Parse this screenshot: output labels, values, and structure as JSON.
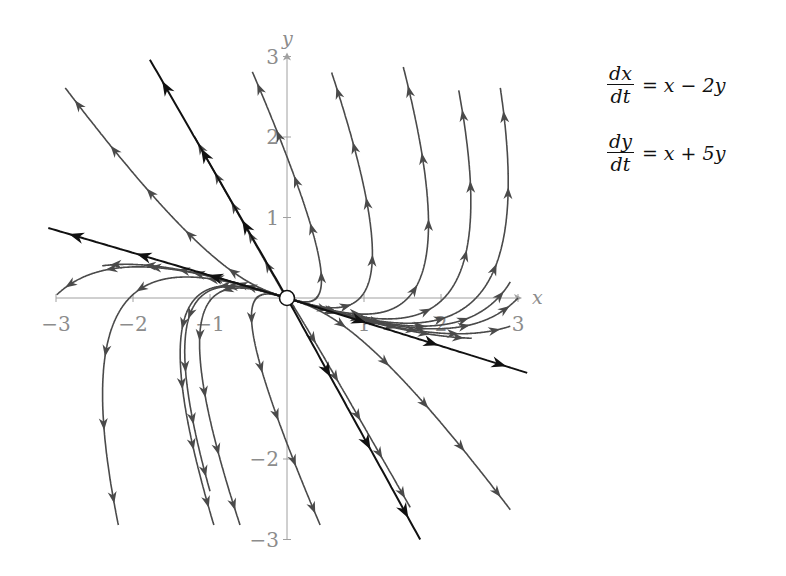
{
  "chart_data": {
    "type": "line",
    "subtype": "phase-portrait",
    "title": "",
    "system": {
      "equation_1": {
        "lhs_num": "dx",
        "lhs_den": "dt",
        "rhs": "= x − 2y"
      },
      "equation_2": {
        "lhs_num": "dy",
        "lhs_den": "dt",
        "rhs": "= x + 5y"
      },
      "matrix": [
        [
          1,
          -2
        ],
        [
          1,
          5
        ]
      ]
    },
    "eigen": {
      "lambda1": 4.414,
      "v1": [
        1,
        -1.707
      ],
      "lambda2": 1.586,
      "v2": [
        1,
        -0.293
      ],
      "type": "unstable node (source) at origin"
    },
    "xlabel": "x",
    "ylabel": "y",
    "xlim": [
      -3,
      3
    ],
    "ylim": [
      -3,
      3
    ],
    "x_ticks": [
      "−3",
      "−2",
      "−1",
      "1",
      "2",
      "3"
    ],
    "y_ticks": [
      "3",
      "2",
      "1",
      "−2",
      "−3"
    ],
    "grid": false,
    "equilibrium": {
      "x": 0,
      "y": 0,
      "style": "open circle"
    },
    "eigen_lines_black": [
      {
        "name": "fast eigen-direction",
        "from": [
          -1.78,
          2.96
        ],
        "to": [
          1.73,
          -3.0
        ]
      },
      {
        "name": "slow eigen-direction",
        "from": [
          -3.1,
          0.87
        ],
        "to": [
          3.12,
          -0.93
        ]
      }
    ],
    "trajectory_endpoints_gray": [
      [
        -2.88,
        2.61
      ],
      [
        -0.45,
        2.81
      ],
      [
        0.58,
        2.8
      ],
      [
        1.51,
        2.87
      ],
      [
        2.23,
        2.58
      ],
      [
        2.77,
        2.61
      ],
      [
        -2.99,
        0.04
      ],
      [
        -2.19,
        -2.82
      ],
      [
        -0.61,
        -2.82
      ],
      [
        0.43,
        -2.82
      ],
      [
        2.9,
        -2.63
      ],
      [
        3.0,
        0.0
      ],
      [
        -1.2,
        2.0
      ],
      [
        -0.95,
        -2.82
      ],
      [
        1.6,
        -2.6
      ],
      [
        2.9,
        -0.35
      ],
      [
        2.4,
        -0.5
      ],
      [
        -2.4,
        0.4
      ],
      [
        -1.0,
        -2.4
      ],
      [
        2.9,
        0.2
      ]
    ]
  },
  "colors": {
    "trajectory": "#4a4a4a",
    "eigenline": "#111111",
    "axis": "#a0a0a0",
    "tick_label": "#8c8c8c"
  }
}
